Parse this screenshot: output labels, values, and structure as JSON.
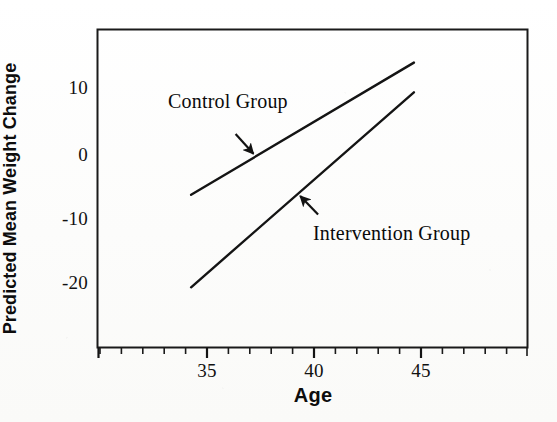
{
  "figure": {
    "x_axis_title": "Age",
    "y_axis_title": "Predicted Mean Weight Change",
    "x_tick_labels": [
      "35",
      "40",
      "45"
    ],
    "y_tick_labels": [
      "10",
      "0",
      "-10",
      "-20"
    ],
    "annotations": {
      "control": "Control Group",
      "intervention": "Intervention Group"
    },
    "line_color": "#141414",
    "frame_color": "#1a1a1a",
    "background_color": "#fdfdfc"
  },
  "chart_data": {
    "type": "line",
    "title": "",
    "subtitle": "",
    "xlabel": "Age",
    "ylabel": "Predicted Mean Weight Change",
    "xlim": [
      30.8,
      50.1
    ],
    "ylim": [
      -29.1,
      19.0
    ],
    "xticks": [
      35,
      40,
      45
    ],
    "yticks": [
      10,
      0,
      -10,
      -20
    ],
    "x_minor_tick_interval": 1,
    "grid": false,
    "legend": "none (inline annotated labels with arrows)",
    "series": [
      {
        "name": "Control Group",
        "x": [
          35,
          45
        ],
        "values": [
          -6,
          14
        ],
        "slope_per_year": 2.0,
        "annotation": {
          "label": "Control Group",
          "label_x": 37.2,
          "label_y": 6.5,
          "arrow_from_x": 37.0,
          "arrow_from_y": 3.2,
          "arrow_to_x": 37.8,
          "arrow_to_y": 0.2,
          "arrow_direction": "down-right"
        }
      },
      {
        "name": "Intervention Group",
        "x": [
          35,
          45
        ],
        "values": [
          -20,
          9.5
        ],
        "slope_per_year": 2.95,
        "annotation": {
          "label": "Intervention Group",
          "label_x": 41.0,
          "label_y": -11.0,
          "arrow_from_x": 40.7,
          "arrow_from_y": -9.0,
          "arrow_to_x": 39.9,
          "arrow_to_y": -6.2,
          "arrow_direction": "up-left"
        }
      }
    ]
  }
}
